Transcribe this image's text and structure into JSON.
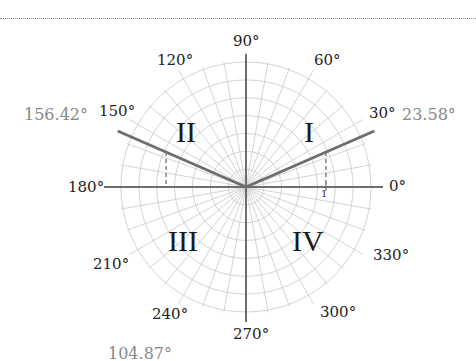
{
  "diagram": {
    "type": "polar-coordinate-grid",
    "center": [
      246,
      187
    ],
    "outer_radius": 125,
    "unit_radius": 80,
    "axis_labels": [
      {
        "angle": 0,
        "text": "0°"
      },
      {
        "angle": 30,
        "text": "30°"
      },
      {
        "angle": 60,
        "text": "60°"
      },
      {
        "angle": 90,
        "text": "90°"
      },
      {
        "angle": 120,
        "text": "120°"
      },
      {
        "angle": 150,
        "text": "150°"
      },
      {
        "angle": 180,
        "text": "180°"
      },
      {
        "angle": 210,
        "text": "210°"
      },
      {
        "angle": 240,
        "text": "240°"
      },
      {
        "angle": 270,
        "text": "270°"
      },
      {
        "angle": 300,
        "text": "300°"
      },
      {
        "angle": 330,
        "text": "330°"
      }
    ],
    "quadrants": [
      "I",
      "II",
      "III",
      "IV"
    ],
    "unit_tick_label": "1",
    "highlighted_angles": [
      {
        "angle": 23.58,
        "text": "23.58°"
      },
      {
        "angle": 156.42,
        "text": "156.42°"
      }
    ],
    "extra_label": "104.87°",
    "colors": {
      "grid": "#c8c8c8",
      "axis": "#6e6e6e",
      "highlight_ray": "#6e6e6e",
      "angle_text": "#888888",
      "label_text": "#222222"
    }
  }
}
